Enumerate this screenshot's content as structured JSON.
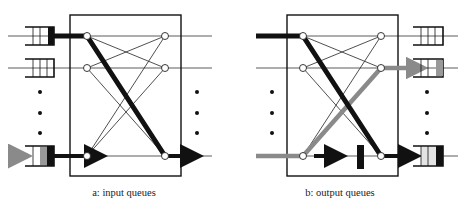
{
  "panels": [
    {
      "id": "a",
      "caption": "a:  input queues",
      "queue_side": "input",
      "highlighted_queue": "bottom"
    },
    {
      "id": "b",
      "caption": "b:  output queues",
      "queue_side": "output",
      "highlighted_queue": "middle"
    }
  ],
  "colors": {
    "line": "#111111",
    "gray_path": "#8a8a8a",
    "queue_fill_gray": "#999999",
    "queue_fill_light": "#e4e4e4",
    "background": "#ffffff"
  }
}
